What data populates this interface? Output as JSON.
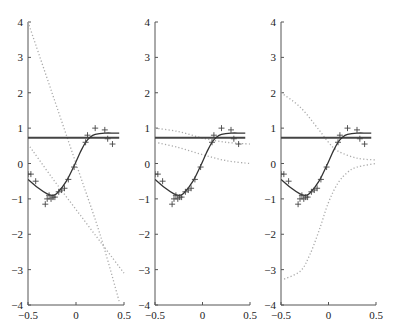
{
  "chart_data": {
    "type": "line",
    "layout": "3 panels side by side, shared y-range",
    "xlim": [
      -0.5,
      0.5
    ],
    "ylim": [
      -4,
      4
    ],
    "xticks": [
      "-0.5",
      "0",
      "0.5"
    ],
    "yticks": [
      "4",
      "3",
      "2",
      "1",
      "0",
      "-1",
      "-2",
      "-3",
      "-4"
    ],
    "grid": false,
    "legend": null,
    "observations": {
      "marker": "+",
      "x": [
        -0.5,
        -0.47,
        -0.42,
        -0.32,
        -0.3,
        -0.28,
        -0.26,
        -0.24,
        -0.22,
        -0.18,
        -0.15,
        -0.12,
        -0.08,
        -0.02,
        0.1,
        0.12,
        0.2,
        0.3,
        0.33,
        0.38
      ],
      "y": [
        -0.3,
        -0.3,
        -0.5,
        -1.15,
        -1.0,
        -0.9,
        -1.0,
        -0.95,
        -0.95,
        -0.8,
        -0.75,
        -0.7,
        -0.45,
        -0.1,
        0.6,
        0.8,
        1.0,
        0.95,
        0.7,
        0.55
      ]
    },
    "fit_curve": {
      "style": "solid",
      "x": [
        -0.5,
        -0.4,
        -0.3,
        -0.25,
        -0.2,
        -0.1,
        0.0,
        0.05,
        0.1,
        0.15,
        0.2,
        0.3,
        0.4,
        0.45
      ],
      "y": [
        -0.45,
        -0.68,
        -0.86,
        -0.9,
        -0.85,
        -0.5,
        0.05,
        0.35,
        0.6,
        0.75,
        0.82,
        0.86,
        0.86,
        0.86
      ]
    },
    "constant_line": {
      "style": "solid-thick",
      "y": 0.73,
      "x": [
        -0.5,
        0.45
      ]
    },
    "panels": [
      {
        "name": "panel-1",
        "dotted_series": [
          {
            "x": [
              -0.5,
              -0.25,
              0.0,
              0.25,
              0.45
            ],
            "y": [
              4.0,
              2.0,
              0.0,
              -2.0,
              -3.9
            ]
          },
          {
            "x": [
              -0.5,
              -0.25,
              0.0,
              0.25,
              0.5
            ],
            "y": [
              0.55,
              -0.4,
              -1.3,
              -2.2,
              -3.1
            ]
          }
        ]
      },
      {
        "name": "panel-2",
        "dotted_series": [
          {
            "x": [
              -0.5,
              -0.25,
              0.0,
              0.25,
              0.5
            ],
            "y": [
              1.0,
              0.9,
              0.72,
              0.6,
              0.55
            ]
          },
          {
            "x": [
              -0.5,
              -0.25,
              0.0,
              0.25,
              0.5
            ],
            "y": [
              0.6,
              0.45,
              0.25,
              0.08,
              0.0
            ]
          }
        ]
      },
      {
        "name": "panel-3",
        "dotted_series": [
          {
            "x": [
              -0.5,
              -0.3,
              -0.1,
              0.0,
              0.1,
              0.3,
              0.5
            ],
            "y": [
              2.0,
              1.6,
              0.95,
              0.6,
              0.35,
              0.15,
              0.1
            ]
          },
          {
            "x": [
              -0.5,
              -0.3,
              -0.2,
              -0.1,
              0.0,
              0.1,
              0.2,
              0.3,
              0.5
            ],
            "y": [
              -3.3,
              -3.05,
              -2.6,
              -1.9,
              -1.1,
              -0.55,
              -0.25,
              -0.1,
              0.0
            ]
          }
        ]
      }
    ]
  }
}
